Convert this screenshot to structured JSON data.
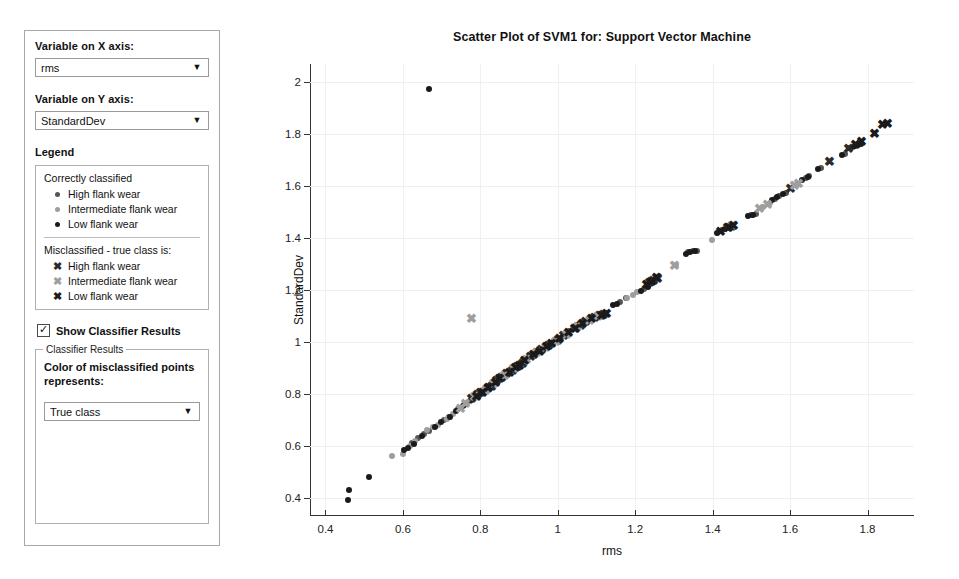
{
  "controls": {
    "x_axis_label": "Variable on X axis:",
    "x_axis_value": "rms",
    "y_axis_label": "Variable on Y axis:",
    "y_axis_value": "StandardDev",
    "dropdown_arrow": "▼",
    "legend_heading": "Legend",
    "legend": {
      "correct_title": "Correctly classified",
      "correct_items": [
        {
          "label": "High flank wear",
          "marker": "dot",
          "color": "#555555"
        },
        {
          "label": "Intermediate flank wear",
          "marker": "dot",
          "color": "#9e9e9e"
        },
        {
          "label": "Low flank wear",
          "marker": "dot",
          "color": "#1a1a1a"
        }
      ],
      "misclassified_title": "Misclassified - true class is:",
      "misclassified_items": [
        {
          "label": "High flank wear",
          "marker": "x",
          "color": "#2b2b2b"
        },
        {
          "label": "Intermediate flank wear",
          "marker": "x",
          "color": "#9e9e9e"
        },
        {
          "label": "Low flank wear",
          "marker": "x",
          "color": "#1a1a1a"
        }
      ],
      "x_glyph": "✖"
    },
    "show_results_label": "Show Classifier Results",
    "show_results_checked": true,
    "check_glyph": "✓",
    "classifier_group_title": "Classifier Results",
    "color_desc": "Color of misclassified points represents:",
    "color_value": "True class"
  },
  "chart_data": {
    "type": "scatter",
    "title": "Scatter Plot of SVM1 for: Support Vector Machine",
    "xlabel": "rms",
    "ylabel": "StandardDev",
    "xlim": [
      0.36,
      1.92
    ],
    "ylim": [
      0.33,
      2.07
    ],
    "xticks": [
      0.4,
      0.6,
      0.8,
      1,
      1.2,
      1.4,
      1.6,
      1.8
    ],
    "yticks": [
      0.4,
      0.6,
      0.8,
      1,
      1.2,
      1.4,
      1.6,
      1.8,
      2
    ],
    "xticklabels": [
      "0.4",
      "0.6",
      "0.8",
      "1",
      "1.2",
      "1.4",
      "1.6",
      "1.8"
    ],
    "yticklabels": [
      "0.4",
      "0.6",
      "0.8",
      "1",
      "1.2",
      "1.4",
      "1.6",
      "1.8",
      "2"
    ],
    "grid": true,
    "legend_position": "external-left-panel",
    "series": [
      {
        "name": "Correctly classified - High flank wear",
        "marker": "dot",
        "color": "#555555",
        "points": [
          [
            0.623,
            0.612
          ],
          [
            0.64,
            0.632
          ],
          [
            0.655,
            0.645
          ],
          [
            0.668,
            0.658
          ],
          [
            0.705,
            0.7
          ],
          [
            0.718,
            0.712
          ],
          [
            0.742,
            0.74
          ],
          [
            0.755,
            0.752
          ],
          [
            0.772,
            0.772
          ],
          [
            0.79,
            0.792
          ],
          [
            0.808,
            0.812
          ],
          [
            0.822,
            0.828
          ],
          [
            0.852,
            0.862
          ],
          [
            0.866,
            0.878
          ],
          [
            0.878,
            0.892
          ],
          [
            0.898,
            0.912
          ],
          [
            0.922,
            0.94
          ],
          [
            0.936,
            0.952
          ],
          [
            0.95,
            0.962
          ],
          [
            0.98,
            0.99
          ],
          [
            1.01,
            1.02
          ],
          [
            1.03,
            1.042
          ],
          [
            1.055,
            1.062
          ],
          [
            1.1,
            1.1
          ],
          [
            1.16,
            1.152
          ],
          [
            1.175,
            1.168
          ],
          [
            1.222,
            1.205
          ],
          [
            1.25,
            1.24
          ],
          [
            1.335,
            1.345
          ],
          [
            1.348,
            1.352
          ],
          [
            1.36,
            1.352
          ],
          [
            1.425,
            1.43
          ],
          [
            1.44,
            1.44
          ],
          [
            1.45,
            1.445
          ],
          [
            1.498,
            1.49
          ],
          [
            1.512,
            1.492
          ],
          [
            1.56,
            1.552
          ],
          [
            1.572,
            1.562
          ],
          [
            1.59,
            1.575
          ],
          [
            1.64,
            1.63
          ],
          [
            1.65,
            1.638
          ],
          [
            1.68,
            1.67
          ],
          [
            1.742,
            1.725
          ],
          [
            1.762,
            1.752
          ],
          [
            1.775,
            1.76
          ]
        ]
      },
      {
        "name": "Correctly classified - Intermediate flank wear",
        "marker": "dot",
        "color": "#9e9e9e",
        "points": [
          [
            0.572,
            0.562
          ],
          [
            0.6,
            0.57
          ],
          [
            0.618,
            0.6
          ],
          [
            0.632,
            0.618
          ],
          [
            0.662,
            0.66
          ],
          [
            0.678,
            0.672
          ],
          [
            0.69,
            0.682
          ],
          [
            0.715,
            0.705
          ],
          [
            0.73,
            0.722
          ],
          [
            0.748,
            0.745
          ],
          [
            0.768,
            0.768
          ],
          [
            0.782,
            0.782
          ],
          [
            0.838,
            0.848
          ],
          [
            0.858,
            0.868
          ],
          [
            0.888,
            0.9
          ],
          [
            0.912,
            0.928
          ],
          [
            0.962,
            0.972
          ],
          [
            0.992,
            1.002
          ],
          [
            1.002,
            1.01
          ],
          [
            1.04,
            1.048
          ],
          [
            1.068,
            1.072
          ],
          [
            1.18,
            1.17
          ],
          [
            1.195,
            1.182
          ],
          [
            1.205,
            1.192
          ],
          [
            1.262,
            1.252
          ],
          [
            1.305,
            1.298
          ],
          [
            1.398,
            1.392
          ],
          [
            1.53,
            1.52
          ],
          [
            1.548,
            1.535
          ],
          [
            1.62,
            1.608
          ]
        ]
      },
      {
        "name": "Correctly classified - Low flank wear",
        "marker": "dot",
        "color": "#1a1a1a",
        "points": [
          [
            0.458,
            0.392
          ],
          [
            0.46,
            0.432
          ],
          [
            0.512,
            0.482
          ],
          [
            0.668,
            1.972
          ],
          [
            0.602,
            0.585
          ],
          [
            0.612,
            0.592
          ],
          [
            0.628,
            0.608
          ],
          [
            0.648,
            0.638
          ],
          [
            0.682,
            0.672
          ],
          [
            0.698,
            0.69
          ],
          [
            0.722,
            0.712
          ],
          [
            0.738,
            0.735
          ],
          [
            0.758,
            0.758
          ],
          [
            0.775,
            0.778
          ],
          [
            0.798,
            0.8
          ],
          [
            0.812,
            0.818
          ],
          [
            0.832,
            0.838
          ],
          [
            0.845,
            0.855
          ],
          [
            0.872,
            0.885
          ],
          [
            0.892,
            0.905
          ],
          [
            0.905,
            0.918
          ],
          [
            0.928,
            0.945
          ],
          [
            0.942,
            0.955
          ],
          [
            0.968,
            0.978
          ],
          [
            0.988,
            0.998
          ],
          [
            1.02,
            1.03
          ],
          [
            1.048,
            1.052
          ],
          [
            1.062,
            1.068
          ],
          [
            1.142,
            1.142
          ],
          [
            1.152,
            1.148
          ],
          [
            1.215,
            1.198
          ],
          [
            1.232,
            1.212
          ],
          [
            1.33,
            1.34
          ],
          [
            1.342,
            1.348
          ],
          [
            1.355,
            1.35
          ],
          [
            1.412,
            1.418
          ],
          [
            1.432,
            1.435
          ],
          [
            1.445,
            1.442
          ],
          [
            1.49,
            1.485
          ],
          [
            1.505,
            1.488
          ],
          [
            1.552,
            1.548
          ],
          [
            1.565,
            1.558
          ],
          [
            1.582,
            1.57
          ],
          [
            1.63,
            1.625
          ],
          [
            1.645,
            1.635
          ],
          [
            1.672,
            1.665
          ],
          [
            1.735,
            1.72
          ],
          [
            1.755,
            1.748
          ],
          [
            1.768,
            1.755
          ],
          [
            1.782,
            1.762
          ]
        ]
      },
      {
        "name": "Misclassified - true class High flank wear",
        "marker": "x",
        "color": "#2b2b2b",
        "points": [
          [
            0.778,
            0.782
          ],
          [
            0.792,
            0.795
          ],
          [
            0.8,
            0.802
          ],
          [
            0.818,
            0.818
          ],
          [
            0.828,
            0.828
          ],
          [
            0.842,
            0.848
          ],
          [
            0.855,
            0.862
          ],
          [
            0.868,
            0.875
          ],
          [
            0.882,
            0.888
          ],
          [
            0.895,
            0.902
          ],
          [
            0.908,
            0.915
          ],
          [
            0.93,
            0.942
          ],
          [
            0.958,
            0.968
          ],
          [
            0.975,
            0.985
          ],
          [
            1.0,
            1.005
          ],
          [
            1.015,
            1.022
          ],
          [
            1.042,
            1.048
          ],
          [
            1.058,
            1.062
          ],
          [
            1.072,
            1.078
          ],
          [
            1.095,
            1.092
          ],
          [
            1.108,
            1.098
          ],
          [
            1.118,
            1.105
          ],
          [
            1.238,
            1.228
          ],
          [
            1.248,
            1.235
          ],
          [
            1.258,
            1.242
          ],
          [
            1.438,
            1.438
          ],
          [
            1.448,
            1.442
          ],
          [
            1.602,
            1.59
          ],
          [
            1.702,
            1.692
          ],
          [
            1.752,
            1.742
          ]
        ]
      },
      {
        "name": "Misclassified - true class Intermediate flank wear",
        "marker": "x",
        "color": "#9e9e9e",
        "points": [
          [
            0.778,
            1.09
          ],
          [
            0.748,
            0.742
          ],
          [
            0.762,
            0.76
          ],
          [
            0.785,
            0.788
          ],
          [
            0.812,
            0.812
          ],
          [
            0.835,
            0.84
          ],
          [
            0.862,
            0.868
          ],
          [
            0.885,
            0.895
          ],
          [
            0.918,
            0.93
          ],
          [
            0.945,
            0.958
          ],
          [
            0.968,
            0.975
          ],
          [
            0.995,
            1.0
          ],
          [
            1.022,
            1.028
          ],
          [
            1.052,
            1.058
          ],
          [
            1.082,
            1.082
          ],
          [
            1.102,
            1.095
          ],
          [
            1.302,
            1.292
          ],
          [
            1.452,
            1.448
          ],
          [
            1.522,
            1.512
          ],
          [
            1.542,
            1.528
          ],
          [
            1.612,
            1.602
          ],
          [
            1.622,
            1.608
          ]
        ]
      },
      {
        "name": "Misclassified - true class Low flank wear",
        "marker": "x",
        "color": "#1a1a1a",
        "points": [
          [
            0.79,
            0.79
          ],
          [
            0.805,
            0.805
          ],
          [
            0.822,
            0.822
          ],
          [
            0.838,
            0.842
          ],
          [
            0.85,
            0.858
          ],
          [
            0.875,
            0.882
          ],
          [
            0.89,
            0.898
          ],
          [
            0.902,
            0.908
          ],
          [
            0.915,
            0.925
          ],
          [
            0.938,
            0.95
          ],
          [
            0.952,
            0.962
          ],
          [
            0.972,
            0.982
          ],
          [
            0.985,
            0.992
          ],
          [
            1.005,
            1.012
          ],
          [
            1.028,
            1.035
          ],
          [
            1.045,
            1.05
          ],
          [
            1.065,
            1.07
          ],
          [
            1.088,
            1.088
          ],
          [
            1.112,
            1.1
          ],
          [
            1.125,
            1.108
          ],
          [
            1.228,
            1.218
          ],
          [
            1.242,
            1.232
          ],
          [
            1.255,
            1.245
          ],
          [
            1.42,
            1.425
          ],
          [
            1.442,
            1.44
          ],
          [
            1.455,
            1.448
          ],
          [
            1.768,
            1.76
          ],
          [
            1.785,
            1.768
          ],
          [
            1.818,
            1.802
          ],
          [
            1.838,
            1.835
          ],
          [
            1.852,
            1.84
          ]
        ]
      }
    ]
  }
}
